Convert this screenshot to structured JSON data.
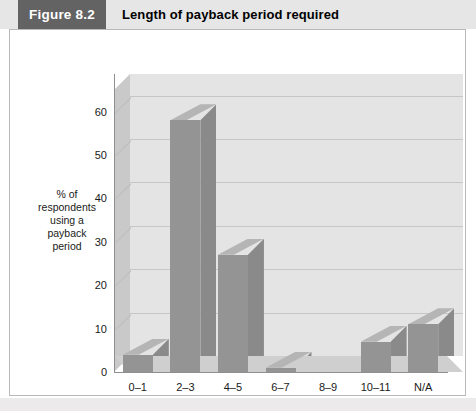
{
  "figure": {
    "number_label": "Figure 8.2",
    "title": "Length of payback period required",
    "number_badge_color": "#636363",
    "header_band_color": "#e6e6e6"
  },
  "chart_data": {
    "type": "bar",
    "title": "Length of payback period required",
    "categories": [
      "0–1",
      "2–3",
      "4–5",
      "6–7",
      "8–9",
      "10–11",
      "N/A"
    ],
    "values": [
      4,
      58,
      27,
      1,
      0,
      7,
      11
    ],
    "xlabel": "Years",
    "ylabel": "% of respondents using a payback period",
    "ylabel_lines": [
      "% of",
      "respondents",
      "using a",
      "payback",
      "period"
    ],
    "ylim": [
      0,
      65
    ],
    "yticks": [
      0,
      10,
      20,
      30,
      40,
      50,
      60
    ],
    "ytick_labels": [
      "0",
      "10",
      "20",
      "30",
      "40",
      "50",
      "60"
    ],
    "grid": true,
    "legend": null,
    "style": "3d-column",
    "bar_color": "#949494",
    "plot_background": "#e4e4e4"
  }
}
